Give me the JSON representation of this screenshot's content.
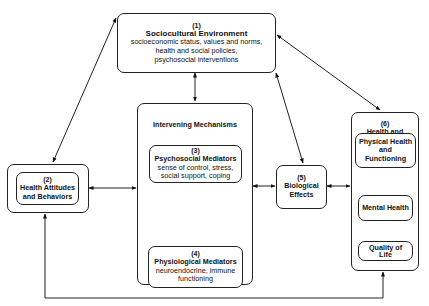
{
  "diagram": {
    "boxes": {
      "sociocultural": {
        "number": "(1)",
        "title": "Sociocultural Environment",
        "lines": [
          "socioeconomic status, values and norms,",
          "health and social policies,",
          "psychosocial interventions"
        ]
      },
      "attitudes": {
        "number": "(2)",
        "title_lines": [
          "Health Attitudes",
          "and Behaviors"
        ]
      },
      "intervening": {
        "title": "Intervening Mechanisms"
      },
      "psychosocial": {
        "number": "(3)",
        "title": "Psychosocial Mediators",
        "lines": [
          "sense of control, stress,",
          "social support, coping"
        ]
      },
      "physiological": {
        "number": "(4)",
        "title": "Physiological Mediators",
        "lines": [
          "neuroendocrine, immune",
          "functioning"
        ]
      },
      "biological": {
        "number": "(5)",
        "title_lines": [
          "Biological",
          "Effects"
        ]
      },
      "outcomes": {
        "number": "(6)",
        "title_lines": [
          "Health and",
          "Illness",
          "Outcomes"
        ],
        "physical": [
          "Physical Health",
          "and",
          "Functioning"
        ],
        "mental": "Mental Health",
        "quality": [
          "Quality of",
          "Life"
        ]
      }
    },
    "connections": [
      {
        "from": "(1)",
        "to": "(2)",
        "type": "bidirectional"
      },
      {
        "from": "(1)",
        "to": "Intervening Mechanisms",
        "type": "bidirectional"
      },
      {
        "from": "(1)",
        "to": "(5)",
        "type": "bidirectional"
      },
      {
        "from": "(1)",
        "to": "(6)",
        "type": "bidirectional"
      },
      {
        "from": "(2)",
        "to": "Intervening Mechanisms",
        "type": "bidirectional"
      },
      {
        "from": "(3)",
        "to": "(4)",
        "type": "bidirectional"
      },
      {
        "from": "Intervening Mechanisms",
        "to": "(5)",
        "type": "bidirectional"
      },
      {
        "from": "(5)",
        "to": "(6)",
        "type": "bidirectional"
      },
      {
        "from": "Physical Health and Functioning",
        "to": "Mental Health",
        "type": "bidirectional"
      },
      {
        "from": "Mental Health",
        "to": "Quality of Life",
        "type": "bidirectional"
      },
      {
        "from": "(6)",
        "to": "(2)",
        "type": "feedback loop along bottom"
      }
    ]
  }
}
